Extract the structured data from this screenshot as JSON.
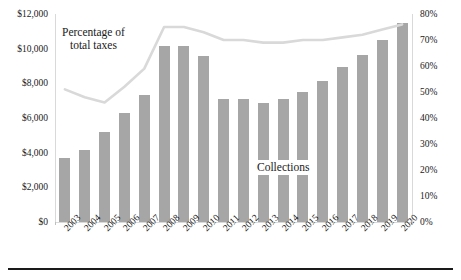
{
  "chart_data": {
    "type": "bar",
    "title": "",
    "xlabel": "",
    "ylabel": "",
    "categories": [
      "2003",
      "2004",
      "2005",
      "2006",
      "2007",
      "2008",
      "2009",
      "2010",
      "2011",
      "2012",
      "2013",
      "2014",
      "2015",
      "2016",
      "2017",
      "2018",
      "2019",
      "2020"
    ],
    "grid": false,
    "legend_position": "annotations-inline",
    "series": [
      {
        "name": "Collections",
        "type": "bar",
        "axis": "left",
        "color": "#a6a6a6",
        "values": [
          3700,
          4150,
          5200,
          6300,
          7300,
          10150,
          10150,
          9550,
          7100,
          7100,
          6850,
          7100,
          7500,
          8150,
          8950,
          9650,
          10500,
          11500
        ]
      },
      {
        "name": "Percentage of total taxes",
        "type": "line",
        "axis": "right",
        "color": "#d9d9d9",
        "values": [
          51,
          48,
          46,
          52,
          59,
          75,
          75,
          73,
          70,
          70,
          69,
          69,
          70,
          70,
          71,
          72,
          74,
          76
        ]
      }
    ],
    "left_axis": {
      "ticks": [
        "$0",
        "$2,000",
        "$4,000",
        "$6,000",
        "$8,000",
        "$10,000",
        "$12,000"
      ],
      "values": [
        0,
        2000,
        4000,
        6000,
        8000,
        10000,
        12000
      ],
      "ylim": [
        0,
        12000
      ]
    },
    "right_axis": {
      "ticks": [
        "0%",
        "10%",
        "20%",
        "30%",
        "40%",
        "50%",
        "60%",
        "70%",
        "80%"
      ],
      "values": [
        0,
        10,
        20,
        30,
        40,
        50,
        60,
        70,
        80
      ],
      "ylim": [
        0,
        80
      ]
    },
    "annotations": [
      {
        "name": "percentage-of-total-taxes",
        "line1": "Percentage of",
        "line2": "total taxes"
      },
      {
        "name": "collections",
        "text": "Collections"
      }
    ]
  },
  "colors": {
    "bar": "#a6a6a6",
    "line": "#d9d9d9",
    "axis": "#d9d9d9",
    "text": "#1a1a1a",
    "rule": "#1a1a1a"
  }
}
